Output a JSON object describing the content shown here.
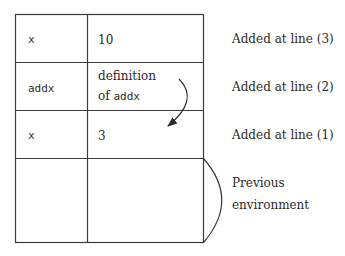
{
  "rows": [
    {
      "name": "x",
      "value": "10",
      "annotation": "Added at line (3)"
    },
    {
      "name": "addx",
      "value_line1": "definition",
      "value_line2_prefix": "of ",
      "value_line2_code": "addx",
      "annotation": "Added at line (2)"
    },
    {
      "name": "x",
      "value": "3",
      "annotation": "Added at line (1)"
    },
    {
      "name": "",
      "value": "",
      "annotation_line1": "Previous",
      "annotation_line2": "environment"
    }
  ],
  "colors": {
    "line": "#3a3a3a",
    "text": "#2a2a2a",
    "background": "#ffffff"
  }
}
